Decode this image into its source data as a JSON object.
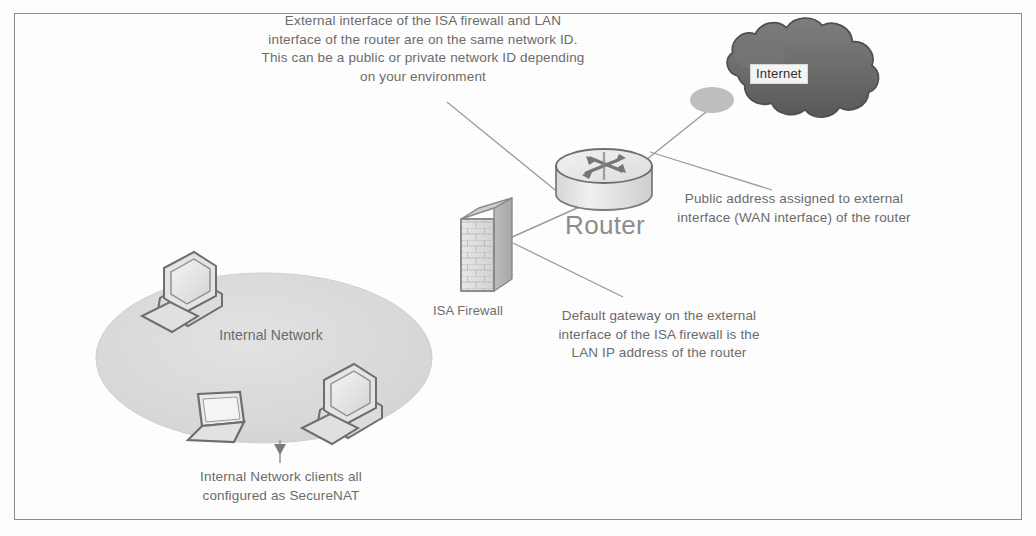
{
  "diagram": {
    "frame_color": "#8c8c8c",
    "background_color": "#ffffff",
    "text_color": "#6b6b6b",
    "ellipse_color": "#d9d9d9",
    "cloud_color": "#6e6e6e"
  },
  "notes": {
    "top_note": "External interface of the ISA firewall and LAN interface of the router are on the same network ID. This can be a public or private network ID depending on your environment",
    "right_note": "Public address assigned to external interface (WAN interface) of the router",
    "center_note": "Default gateway on the external interface of the ISA firewall is the LAN IP address of the router",
    "bottom_note": "Internal Network clients all configured as SecureNAT"
  },
  "labels": {
    "internet": "Internet",
    "router": "Router",
    "isa_firewall": "ISA Firewall",
    "internal_network": "Internal Network"
  },
  "nodes": [
    {
      "id": "internet-cloud",
      "label": "Internet",
      "icon": "cloud-icon"
    },
    {
      "id": "router",
      "label": "Router",
      "icon": "router-icon"
    },
    {
      "id": "isa-firewall",
      "label": "ISA Firewall",
      "icon": "brick-wall-icon"
    },
    {
      "id": "internal-network",
      "label": "Internal Network",
      "icon": "network-ellipse-icon"
    },
    {
      "id": "desktop-pc-top",
      "label": "",
      "icon": "desktop-computer-icon"
    },
    {
      "id": "laptop",
      "label": "",
      "icon": "laptop-icon"
    },
    {
      "id": "desktop-pc-bottom",
      "label": "",
      "icon": "desktop-computer-icon"
    }
  ],
  "connectors": [
    {
      "from": "isa-firewall",
      "to": "router",
      "type": "link-line"
    },
    {
      "from": "router",
      "to": "internet-cloud",
      "type": "link-line"
    },
    {
      "from": "top_note",
      "to": "link-segment",
      "type": "leader-line"
    },
    {
      "from": "right_note",
      "to": "router",
      "type": "leader-line"
    },
    {
      "from": "center_note",
      "to": "isa-firewall",
      "type": "leader-line"
    },
    {
      "from": "bottom_note",
      "to": "internal-network",
      "type": "leader-line"
    }
  ]
}
